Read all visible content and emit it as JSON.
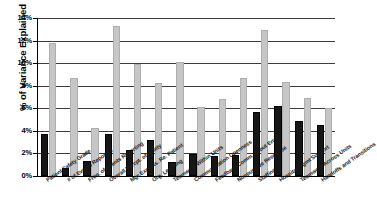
{
  "chart_data": {
    "type": "bar",
    "title": "",
    "xlabel": "",
    "ylabel": "% of Variance Explained",
    "ylim": [
      0,
      14
    ],
    "ytick_labels": [
      "14%",
      "12%",
      "10%",
      "8%",
      "6%",
      "4%",
      "2%",
      "0%"
    ],
    "ytick_values": [
      14,
      12,
      10,
      8,
      6,
      4,
      2,
      0
    ],
    "grid": true,
    "legend": "none",
    "categories": [
      "Patient Safety Grade",
      "# of Events Reported",
      "Freq. of Events Reporting",
      "Overall Percpt. of Safety",
      "Mgr Expects. Re. Patient",
      "Org. Learning",
      "Teamwork Within Units",
      "Communication Openness",
      "Feedback/Comm. About Error",
      "Nonpunitive Response",
      "Staffing",
      "Hospital Mgmt Support",
      "Teamwork Across Units",
      "Handoffs and Transitions"
    ],
    "series": [
      {
        "name": "black-series",
        "color": "#161616",
        "values": [
          3.7,
          0.7,
          1.35,
          3.75,
          2.3,
          3.2,
          1.25,
          1.95,
          1.8,
          1.85,
          5.7,
          6.2,
          4.85,
          4.55
        ]
      },
      {
        "name": "gray-series",
        "color": "#c6c6c6",
        "values": [
          11.8,
          8.65,
          4.25,
          13.3,
          9.95,
          8.25,
          10.1,
          6.1,
          6.8,
          8.7,
          12.9,
          8.35,
          6.9,
          6.0
        ]
      }
    ]
  }
}
